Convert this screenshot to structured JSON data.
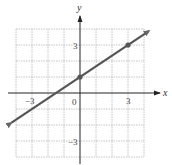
{
  "chart_data": {
    "type": "line",
    "title": "",
    "xlabel": "x",
    "ylabel": "y",
    "xlim": [
      -4,
      4
    ],
    "ylim": [
      -4,
      4
    ],
    "grid": true,
    "x_tick_labels": [
      "-3",
      "0",
      "3"
    ],
    "y_tick_labels": [
      "3",
      "-3"
    ],
    "series": [
      {
        "name": "y = (2/3)x + 1",
        "equation": "y = (2/3)x + 1",
        "slope": 0.6667,
        "intercept": 1,
        "x": [
          -4.3,
          0,
          3,
          4.3
        ],
        "y": [
          -1.87,
          1,
          3,
          3.87
        ],
        "marked_points": [
          [
            0,
            1
          ],
          [
            3,
            3
          ]
        ],
        "arrows_both_ends": true,
        "color": "#555555"
      }
    ]
  },
  "labels": {
    "x_axis": "x",
    "y_axis": "y",
    "tick_x_neg3": "−3",
    "tick_origin": "0",
    "tick_x_3": "3",
    "tick_y_3": "3",
    "tick_y_neg3": "−3"
  }
}
